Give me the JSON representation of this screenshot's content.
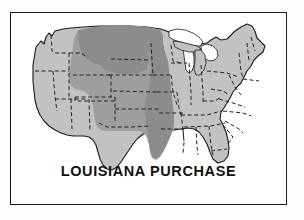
{
  "figure": {
    "caption": "LOUISIANA PURCHASE",
    "frame": {
      "border_color": "#1a1a1a",
      "background": "#ffffff"
    },
    "page_background": "#fdfdfd"
  },
  "map": {
    "title": "LOUISIANA PURCHASE",
    "region_name": "United States",
    "projection_note": "contiguous United States outline with state boundaries",
    "state_border_style": "dashed",
    "state_border_color": "#222222",
    "coast_border_color": "#1a1a1a",
    "lakes_color": "#ffffff",
    "legend_categories": [
      {
        "id": "purchase-dark",
        "label": "Louisiana Purchase territory (darkest shading)",
        "color": "#8c8c8c"
      },
      {
        "id": "purchase-mid",
        "label": "Louisiana Purchase territory",
        "color": "#9e9e9e"
      },
      {
        "id": "non-purchase",
        "label": "Territory outside the Louisiana Purchase",
        "color": "#c2c2c2"
      }
    ],
    "purchase_states": [
      "Louisiana",
      "Arkansas",
      "Missouri",
      "Iowa",
      "Minnesota",
      "North Dakota",
      "South Dakota",
      "Nebraska",
      "Kansas",
      "Oklahoma",
      "Montana",
      "Wyoming",
      "Colorado"
    ],
    "non_purchase_states": [
      "Washington",
      "Oregon",
      "Idaho",
      "California",
      "Nevada",
      "Utah",
      "Arizona",
      "New Mexico",
      "Texas",
      "Wisconsin",
      "Illinois",
      "Michigan",
      "Indiana",
      "Ohio",
      "Kentucky",
      "Tennessee",
      "Mississippi",
      "Alabama",
      "Georgia",
      "Florida",
      "South Carolina",
      "North Carolina",
      "Virginia",
      "West Virginia",
      "Maryland",
      "Delaware",
      "Pennsylvania",
      "New Jersey",
      "New York",
      "Connecticut",
      "Rhode Island",
      "Massachusetts",
      "Vermont",
      "New Hampshire",
      "Maine"
    ]
  }
}
